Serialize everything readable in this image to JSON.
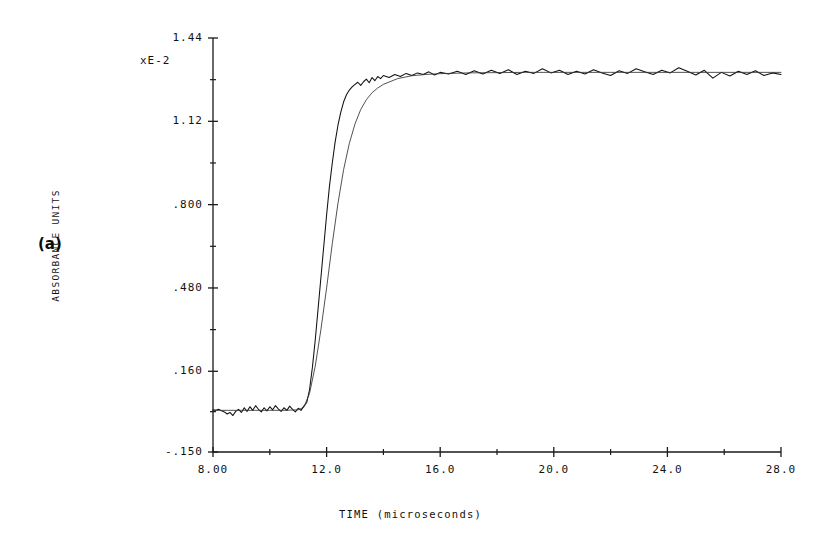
{
  "figure": {
    "panel_label": "(a)",
    "scale_note": "xE-2"
  },
  "chart_data": {
    "type": "line",
    "title": "",
    "xlabel": "TIME (microseconds)",
    "ylabel": "ABSORBANCE UNITS",
    "y_scale_note": "xE-2",
    "xlim": [
      8.0,
      28.0
    ],
    "ylim": [
      -0.15,
      1.44
    ],
    "grid": false,
    "legend": "none",
    "x_ticks": [
      8.0,
      12.0,
      16.0,
      20.0,
      24.0,
      28.0
    ],
    "x_tick_labels": [
      "8.00",
      "12.0",
      "16.0",
      "20.0",
      "24.0",
      "28.0"
    ],
    "x_minor_ticks": [
      10.0,
      14.0,
      18.0,
      22.0,
      26.0
    ],
    "y_ticks": [
      -0.15,
      0.16,
      0.48,
      0.8,
      1.12,
      1.44
    ],
    "y_tick_labels": [
      "-.150",
      ".160",
      ".480",
      ".800",
      "1.12",
      "1.44"
    ],
    "y_minor_ticks": [
      0.005,
      0.32,
      0.64,
      0.96,
      1.28
    ],
    "series": [
      {
        "name": "experimental-trace",
        "style": "noisy",
        "x": [
          8.0,
          8.1,
          8.2,
          8.3,
          8.4,
          8.5,
          8.6,
          8.7,
          8.8,
          8.9,
          9.0,
          9.1,
          9.2,
          9.3,
          9.4,
          9.5,
          9.6,
          9.7,
          9.8,
          9.9,
          10.0,
          10.1,
          10.2,
          10.3,
          10.4,
          10.5,
          10.6,
          10.7,
          10.8,
          10.9,
          11.0,
          11.1,
          11.2,
          11.3,
          11.4,
          11.5,
          11.6,
          11.7,
          11.8,
          11.9,
          12.0,
          12.1,
          12.2,
          12.3,
          12.4,
          12.5,
          12.6,
          12.7,
          12.8,
          12.9,
          13.0,
          13.1,
          13.2,
          13.3,
          13.4,
          13.5,
          13.6,
          13.7,
          13.8,
          13.9,
          14.0,
          14.2,
          14.4,
          14.6,
          14.8,
          15.0,
          15.2,
          15.4,
          15.6,
          15.8,
          16.0,
          16.3,
          16.6,
          16.9,
          17.2,
          17.5,
          17.8,
          18.1,
          18.4,
          18.7,
          19.0,
          19.3,
          19.6,
          19.9,
          20.2,
          20.5,
          20.8,
          21.1,
          21.4,
          21.7,
          22.0,
          22.3,
          22.6,
          22.9,
          23.2,
          23.5,
          23.8,
          24.1,
          24.4,
          24.7,
          25.0,
          25.3,
          25.6,
          25.9,
          26.2,
          26.5,
          26.8,
          27.1,
          27.4,
          27.7,
          28.0
        ],
        "y": [
          0.012,
          0.01,
          0.014,
          0.008,
          0.004,
          -0.004,
          0.002,
          -0.01,
          0.006,
          0.014,
          0.002,
          0.02,
          0.006,
          0.024,
          0.01,
          0.028,
          0.014,
          0.004,
          0.02,
          0.008,
          0.024,
          0.012,
          0.028,
          0.016,
          0.006,
          0.02,
          0.01,
          0.026,
          0.014,
          0.004,
          0.018,
          0.01,
          0.026,
          0.04,
          0.09,
          0.175,
          0.28,
          0.4,
          0.52,
          0.64,
          0.76,
          0.87,
          0.96,
          1.04,
          1.105,
          1.155,
          1.195,
          1.222,
          1.24,
          1.252,
          1.262,
          1.27,
          1.258,
          1.272,
          1.282,
          1.268,
          1.288,
          1.276,
          1.292,
          1.284,
          1.296,
          1.288,
          1.3,
          1.292,
          1.304,
          1.296,
          1.306,
          1.3,
          1.31,
          1.298,
          1.308,
          1.302,
          1.312,
          1.3,
          1.314,
          1.302,
          1.316,
          1.304,
          1.318,
          1.3,
          1.312,
          1.304,
          1.322,
          1.306,
          1.316,
          1.3,
          1.312,
          1.302,
          1.318,
          1.306,
          1.296,
          1.314,
          1.304,
          1.322,
          1.31,
          1.3,
          1.316,
          1.306,
          1.326,
          1.312,
          1.298,
          1.316,
          1.286,
          1.308,
          1.294,
          1.312,
          1.3,
          1.314,
          1.296,
          1.306,
          1.3
        ]
      },
      {
        "name": "fitted-curve",
        "style": "smooth",
        "x": [
          8.0,
          8.5,
          9.0,
          9.5,
          10.0,
          10.5,
          11.0,
          11.2,
          11.4,
          11.6,
          11.8,
          12.0,
          12.2,
          12.4,
          12.6,
          12.8,
          13.0,
          13.2,
          13.4,
          13.6,
          13.8,
          14.0,
          14.5,
          15.0,
          15.5,
          16.0,
          17.0,
          18.0,
          19.0,
          20.0,
          21.0,
          22.0,
          23.0,
          24.0,
          25.0,
          26.0,
          27.0,
          28.0
        ],
        "y": [
          0.01,
          0.01,
          0.01,
          0.01,
          0.01,
          0.01,
          0.012,
          0.022,
          0.075,
          0.18,
          0.32,
          0.48,
          0.65,
          0.805,
          0.935,
          1.035,
          1.11,
          1.165,
          1.203,
          1.23,
          1.248,
          1.262,
          1.284,
          1.295,
          1.3,
          1.303,
          1.306,
          1.307,
          1.308,
          1.308,
          1.308,
          1.308,
          1.308,
          1.308,
          1.308,
          1.308,
          1.308,
          1.308
        ]
      }
    ]
  }
}
